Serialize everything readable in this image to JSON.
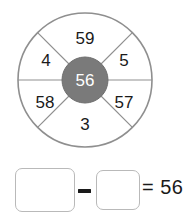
{
  "exercise": {
    "type": "number-wheel-subtraction",
    "wheel": {
      "center_value": "56",
      "segments": [
        {
          "label": "59",
          "position": "top",
          "x": 85,
          "y": 38
        },
        {
          "label": "5",
          "position": "upper-right",
          "x": 124,
          "y": 60
        },
        {
          "label": "57",
          "position": "lower-right",
          "x": 124,
          "y": 102
        },
        {
          "label": "3",
          "position": "bottom",
          "x": 85,
          "y": 124
        },
        {
          "label": "58",
          "position": "lower-left",
          "x": 45,
          "y": 102
        },
        {
          "label": "4",
          "position": "upper-left",
          "x": 46,
          "y": 60
        }
      ],
      "geometry": {
        "center_x": 85,
        "center_y": 80,
        "outer_radius": 67,
        "hub_radius": 23
      },
      "colors": {
        "hub_fill": "#7a7a7a",
        "hub_text": "#ffffff",
        "stroke": "#8f8f8f",
        "segment_fill": "#ffffff",
        "label_text": "#1a1a1a"
      }
    },
    "equation": {
      "minuend_value": "",
      "minuend_placeholder": "",
      "operator": "−",
      "subtrahend_value": "",
      "subtrahend_placeholder": "",
      "result_text": "= 56",
      "result_value": "56"
    }
  }
}
